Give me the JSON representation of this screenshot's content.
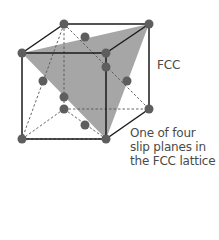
{
  "labels": {
    "structure": "FCC",
    "caption_lines": [
      "One of four",
      "slip planes in",
      "the FCC lattice"
    ]
  },
  "colors": {
    "plane": "#a6a6a6",
    "edge": "#1a1a1a",
    "dashed": "#555555",
    "atom": "#5e5e5e",
    "text": "#4a4a4a"
  }
}
